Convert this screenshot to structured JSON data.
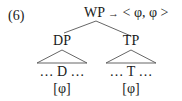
{
  "example_number": "(6)",
  "root": {
    "label": "WP",
    "arrow": "→",
    "value": "< φ, φ >"
  },
  "left_child": {
    "label": "DP",
    "terminal": "… D …",
    "feature": "[φ]"
  },
  "right_child": {
    "label": "TP",
    "terminal": "… T …",
    "feature": "[φ]"
  },
  "colors": {
    "text": "#1a1a1a",
    "lines": "#555555",
    "background": "#ffffff"
  }
}
